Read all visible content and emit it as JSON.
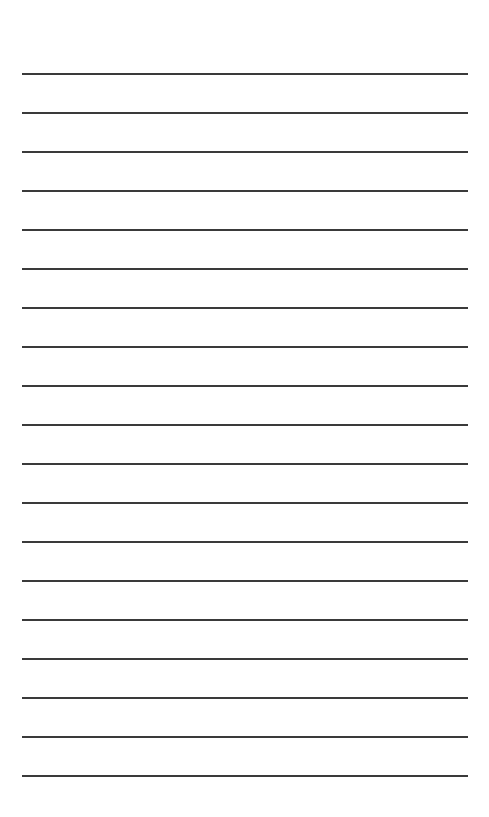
{
  "page": {
    "type": "lined-paper",
    "background_color": "#ffffff",
    "line_color": "#3a3a3a",
    "line_count": 19,
    "first_line_y": 73,
    "line_spacing": 39,
    "line_left": 22,
    "line_width": 446,
    "lines": [
      {
        "index": 1,
        "text": ""
      },
      {
        "index": 2,
        "text": ""
      },
      {
        "index": 3,
        "text": ""
      },
      {
        "index": 4,
        "text": ""
      },
      {
        "index": 5,
        "text": ""
      },
      {
        "index": 6,
        "text": ""
      },
      {
        "index": 7,
        "text": ""
      },
      {
        "index": 8,
        "text": ""
      },
      {
        "index": 9,
        "text": ""
      },
      {
        "index": 10,
        "text": ""
      },
      {
        "index": 11,
        "text": ""
      },
      {
        "index": 12,
        "text": ""
      },
      {
        "index": 13,
        "text": ""
      },
      {
        "index": 14,
        "text": ""
      },
      {
        "index": 15,
        "text": ""
      },
      {
        "index": 16,
        "text": ""
      },
      {
        "index": 17,
        "text": ""
      },
      {
        "index": 18,
        "text": ""
      },
      {
        "index": 19,
        "text": ""
      }
    ]
  }
}
